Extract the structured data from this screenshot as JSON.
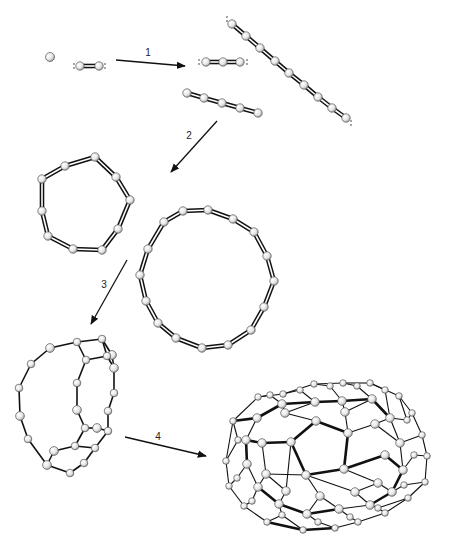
{
  "figure": {
    "colors": {
      "atom_fill": "#e4e4e4",
      "atom_stroke": "#555555",
      "bond": "#111111",
      "arrow": "#111111",
      "bg": "#ffffff"
    },
    "steps": [
      {
        "label": "1",
        "from": [
          116,
          60
        ],
        "to": [
          185,
          66
        ],
        "label_pos": [
          148,
          56
        ]
      },
      {
        "label": "2",
        "from": [
          217,
          121
        ],
        "to": [
          171,
          172
        ],
        "label_pos": [
          189,
          139
        ]
      },
      {
        "label": "3",
        "from": [
          127,
          260
        ],
        "to": [
          91,
          324
        ],
        "label_pos": [
          104,
          288
        ]
      },
      {
        "label": "4",
        "from": [
          125,
          437
        ],
        "to": [
          206,
          456
        ],
        "label_pos": [
          158,
          440
        ]
      }
    ],
    "species": [
      {
        "name": "carbon-atom",
        "atoms": [
          [
            50,
            57
          ]
        ],
        "bond": "none",
        "lone_pairs": []
      },
      {
        "name": "C2-dimer",
        "atoms": [
          [
            80,
            66
          ],
          [
            99,
            66
          ]
        ],
        "bond": "double",
        "lone_pairs": [
          [
            74,
            66
          ],
          [
            105,
            66
          ]
        ]
      },
      {
        "name": "C3-linear",
        "atoms": [
          [
            206,
            62
          ],
          [
            223,
            62
          ],
          [
            240,
            62
          ]
        ],
        "bond": "double",
        "lone_pairs": [
          [
            199,
            62
          ],
          [
            247,
            62
          ]
        ]
      },
      {
        "name": "C5-chain",
        "atoms": [
          [
            187,
            93
          ],
          [
            204,
            98
          ],
          [
            222,
            103
          ],
          [
            240,
            108
          ],
          [
            258,
            113
          ]
        ],
        "bond": "double",
        "lone_pairs": []
      },
      {
        "name": "C9-chain",
        "atoms": [
          [
            232,
            24
          ],
          [
            246,
            36
          ],
          [
            260,
            48
          ],
          [
            275,
            61
          ],
          [
            289,
            73
          ],
          [
            304,
            85
          ],
          [
            318,
            97
          ],
          [
            332,
            108
          ],
          [
            346,
            118
          ]
        ],
        "bond": "double",
        "lone_pairs": [
          [
            227,
            19
          ],
          [
            351,
            123
          ]
        ]
      },
      {
        "name": "C10-ring",
        "atoms": [
          [
            42,
            179
          ],
          [
            65,
            166
          ],
          [
            95,
            157
          ],
          [
            116,
            177
          ],
          [
            130,
            200
          ],
          [
            118,
            229
          ],
          [
            102,
            250
          ],
          [
            73,
            249
          ],
          [
            48,
            236
          ],
          [
            42,
            211
          ]
        ],
        "bond": "double",
        "ring": true,
        "lone_pairs": []
      },
      {
        "name": "C16-ring",
        "atoms": [
          [
            164,
            222
          ],
          [
            183,
            211
          ],
          [
            208,
            210
          ],
          [
            233,
            219
          ],
          [
            254,
            232
          ],
          [
            267,
            256
          ],
          [
            274,
            281
          ],
          [
            264,
            307
          ],
          [
            251,
            330
          ],
          [
            228,
            345
          ],
          [
            202,
            348
          ],
          [
            176,
            338
          ],
          [
            158,
            323
          ],
          [
            146,
            301
          ],
          [
            140,
            275
          ],
          [
            148,
            249
          ]
        ],
        "bond": "double",
        "ring": true,
        "lone_pairs": []
      }
    ],
    "cage": {
      "name": "partial-cage",
      "atoms": [
        [
          50,
          348
        ],
        [
          77,
          342
        ],
        [
          102,
          339
        ],
        [
          112,
          355
        ],
        [
          86,
          360
        ],
        [
          107,
          356
        ],
        [
          114,
          368
        ],
        [
          77,
          383
        ],
        [
          114,
          393
        ],
        [
          77,
          410
        ],
        [
          108,
          411
        ],
        [
          85,
          428
        ],
        [
          97,
          428
        ],
        [
          108,
          431
        ],
        [
          75,
          446
        ],
        [
          54,
          451
        ],
        [
          95,
          448
        ],
        [
          84,
          463
        ],
        [
          47,
          465
        ],
        [
          70,
          473
        ],
        [
          28,
          439
        ],
        [
          20,
          416
        ],
        [
          19,
          388
        ],
        [
          31,
          364
        ]
      ],
      "edges": [
        [
          0,
          1
        ],
        [
          1,
          2
        ],
        [
          1,
          4
        ],
        [
          2,
          3
        ],
        [
          4,
          5
        ],
        [
          5,
          6
        ],
        [
          3,
          6
        ],
        [
          4,
          7
        ],
        [
          7,
          9
        ],
        [
          9,
          11
        ],
        [
          11,
          12
        ],
        [
          12,
          13
        ],
        [
          13,
          10
        ],
        [
          10,
          8
        ],
        [
          8,
          6
        ],
        [
          11,
          14
        ],
        [
          14,
          15
        ],
        [
          14,
          16
        ],
        [
          16,
          13
        ],
        [
          16,
          17
        ],
        [
          17,
          19
        ],
        [
          19,
          18
        ],
        [
          18,
          15
        ],
        [
          18,
          20
        ],
        [
          20,
          21
        ],
        [
          21,
          22
        ],
        [
          22,
          23
        ],
        [
          23,
          0
        ],
        [
          2,
          5
        ]
      ]
    },
    "fullerene": {
      "name": "fullerene-C70",
      "atoms": [
        [
          233,
          421
        ],
        [
          258,
          397
        ],
        [
          283,
          394
        ],
        [
          314,
          384
        ],
        [
          343,
          383
        ],
        [
          370,
          383
        ],
        [
          399,
          396
        ],
        [
          412,
          413
        ],
        [
          422,
          435
        ],
        [
          427,
          456
        ],
        [
          425,
          482
        ],
        [
          408,
          498
        ],
        [
          385,
          513
        ],
        [
          358,
          522
        ],
        [
          335,
          528
        ],
        [
          303,
          530
        ],
        [
          267,
          522
        ],
        [
          244,
          506
        ],
        [
          229,
          486
        ],
        [
          226,
          461
        ],
        [
          316,
          421
        ],
        [
          348,
          433
        ],
        [
          344,
          469
        ],
        [
          306,
          475
        ],
        [
          291,
          442
        ],
        [
          257,
          418
        ],
        [
          282,
          404
        ],
        [
          315,
          402
        ],
        [
          342,
          401
        ],
        [
          372,
          399
        ],
        [
          390,
          418
        ],
        [
          400,
          443
        ],
        [
          403,
          470
        ],
        [
          392,
          492
        ],
        [
          370,
          505
        ],
        [
          339,
          509
        ],
        [
          307,
          514
        ],
        [
          279,
          504
        ],
        [
          258,
          487
        ],
        [
          247,
          464
        ],
        [
          246,
          440
        ],
        [
          262,
          443
        ],
        [
          285,
          413
        ],
        [
          345,
          412
        ],
        [
          375,
          424
        ],
        [
          385,
          455
        ],
        [
          378,
          483
        ],
        [
          355,
          492
        ],
        [
          320,
          496
        ],
        [
          286,
          491
        ],
        [
          266,
          474
        ],
        [
          270,
          395
        ],
        [
          300,
          390
        ],
        [
          330,
          386
        ],
        [
          357,
          386
        ],
        [
          385,
          390
        ],
        [
          238,
          440
        ],
        [
          237,
          478
        ],
        [
          252,
          501
        ],
        [
          282,
          515
        ],
        [
          318,
          522
        ],
        [
          350,
          517
        ],
        [
          378,
          508
        ],
        [
          404,
          485
        ],
        [
          414,
          455
        ],
        [
          407,
          420
        ]
      ],
      "edges": [
        [
          0,
          1
        ],
        [
          1,
          2
        ],
        [
          2,
          3
        ],
        [
          3,
          4
        ],
        [
          4,
          5
        ],
        [
          5,
          6
        ],
        [
          6,
          7
        ],
        [
          7,
          8
        ],
        [
          8,
          9
        ],
        [
          9,
          10
        ],
        [
          10,
          11
        ],
        [
          11,
          12
        ],
        [
          12,
          13
        ],
        [
          13,
          14
        ],
        [
          14,
          15
        ],
        [
          15,
          16
        ],
        [
          16,
          17
        ],
        [
          17,
          18
        ],
        [
          18,
          19
        ],
        [
          19,
          0
        ],
        [
          20,
          21
        ],
        [
          21,
          22
        ],
        [
          22,
          23
        ],
        [
          23,
          24
        ],
        [
          24,
          20
        ],
        [
          25,
          26
        ],
        [
          26,
          27
        ],
        [
          27,
          28
        ],
        [
          28,
          29
        ],
        [
          29,
          30
        ],
        [
          30,
          31
        ],
        [
          31,
          32
        ],
        [
          32,
          33
        ],
        [
          33,
          34
        ],
        [
          34,
          35
        ],
        [
          35,
          36
        ],
        [
          36,
          37
        ],
        [
          37,
          38
        ],
        [
          38,
          39
        ],
        [
          39,
          40
        ],
        [
          40,
          25
        ],
        [
          24,
          41
        ],
        [
          20,
          42
        ],
        [
          21,
          43
        ],
        [
          21,
          44
        ],
        [
          22,
          45
        ],
        [
          22,
          46
        ],
        [
          23,
          47
        ],
        [
          23,
          48
        ],
        [
          24,
          49
        ],
        [
          23,
          50
        ],
        [
          41,
          40
        ],
        [
          41,
          50
        ],
        [
          42,
          26
        ],
        [
          42,
          27
        ],
        [
          43,
          28
        ],
        [
          43,
          29
        ],
        [
          44,
          30
        ],
        [
          44,
          31
        ],
        [
          45,
          32
        ],
        [
          46,
          33
        ],
        [
          46,
          47
        ],
        [
          47,
          34
        ],
        [
          48,
          35
        ],
        [
          48,
          36
        ],
        [
          49,
          37
        ],
        [
          50,
          38
        ],
        [
          49,
          50
        ],
        [
          0,
          25
        ],
        [
          1,
          51
        ],
        [
          51,
          26
        ],
        [
          2,
          52
        ],
        [
          52,
          27
        ],
        [
          3,
          53
        ],
        [
          53,
          28
        ],
        [
          4,
          54
        ],
        [
          54,
          29
        ],
        [
          5,
          55
        ],
        [
          55,
          30
        ],
        [
          6,
          65
        ],
        [
          65,
          30
        ],
        [
          7,
          65
        ],
        [
          8,
          31
        ],
        [
          9,
          64
        ],
        [
          64,
          32
        ],
        [
          10,
          63
        ],
        [
          63,
          33
        ],
        [
          11,
          62
        ],
        [
          12,
          62
        ],
        [
          62,
          34
        ],
        [
          13,
          61
        ],
        [
          61,
          35
        ],
        [
          14,
          60
        ],
        [
          60,
          36
        ],
        [
          15,
          59
        ],
        [
          59,
          37
        ],
        [
          16,
          59
        ],
        [
          17,
          58
        ],
        [
          58,
          38
        ],
        [
          18,
          57
        ],
        [
          57,
          39
        ],
        [
          19,
          56
        ],
        [
          56,
          40
        ],
        [
          0,
          56
        ]
      ],
      "bold_edges": [
        [
          20,
          21
        ],
        [
          21,
          22
        ],
        [
          22,
          23
        ],
        [
          23,
          24
        ],
        [
          24,
          20
        ],
        [
          0,
          25
        ],
        [
          25,
          26
        ],
        [
          26,
          27
        ],
        [
          27,
          28
        ],
        [
          28,
          29
        ],
        [
          29,
          30
        ],
        [
          32,
          33
        ],
        [
          33,
          34
        ],
        [
          35,
          36
        ],
        [
          36,
          37
        ],
        [
          37,
          38
        ],
        [
          14,
          15
        ],
        [
          15,
          16
        ],
        [
          22,
          45
        ],
        [
          45,
          32
        ],
        [
          24,
          41
        ],
        [
          41,
          40
        ],
        [
          39,
          40
        ]
      ]
    }
  }
}
